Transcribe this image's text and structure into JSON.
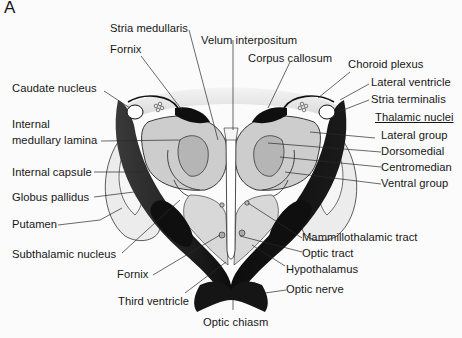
{
  "figure": {
    "panel_letter": "A",
    "colors": {
      "white_matter": "#111111",
      "gray_nucleus": "#c9c9c9",
      "light_gray": "#e2e2e2",
      "ventricle": "#ffffff",
      "line": "#222222"
    },
    "labels": {
      "stria_medullaris": "Stria medullaris",
      "fornix_top": "Fornix",
      "velum_interpositum": "Velum interpositum",
      "corpus_callosum": "Corpus callosum",
      "caudate_nucleus": "Caudate nucleus",
      "choroid_plexus": "Choroid plexus",
      "lateral_ventricle": "Lateral ventricle",
      "stria_terminalis": "Stria terminalis",
      "internal_medullary_lamina_1": "Internal",
      "internal_medullary_lamina_2": "medullary lamina",
      "thalamic_nuclei_heading": "Thalamic nuclei",
      "lateral_group": "Lateral group",
      "dorsomedial": "Dorsomedial",
      "centromedian": "Centromedian",
      "ventral_group": "Ventral group",
      "internal_capsule": "Internal capsule",
      "globus_pallidus": "Globus pallidus",
      "putamen": "Putamen",
      "subthalamic_nucleus": "Subthalamic nucleus",
      "mammillothalamic_tract": "Mammillothalamic tract",
      "optic_tract": "Optic tract",
      "hypothalamus": "Hypothalamus",
      "fornix_bottom": "Fornix",
      "optic_nerve": "Optic nerve",
      "third_ventricle": "Third ventricle",
      "optic_chiasm": "Optic chiasm"
    }
  }
}
